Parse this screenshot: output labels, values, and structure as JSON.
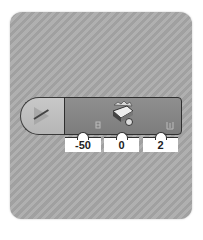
{
  "program": {
    "start_block": {
      "icon": "play-icon"
    },
    "motor_block": {
      "icon": "large-motor-icon",
      "inputs": [
        {
          "name": "power",
          "icon": "power-icon",
          "value": "-50"
        },
        {
          "name": "steering",
          "icon": "steering-icon",
          "value": "0"
        },
        {
          "name": "rotations",
          "icon": "rotations-icon",
          "value": "2"
        }
      ]
    }
  }
}
